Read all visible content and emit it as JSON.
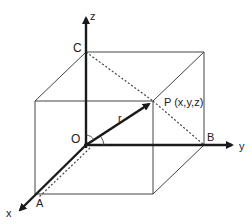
{
  "diagram": {
    "axes": {
      "x": {
        "label": "x"
      },
      "y": {
        "label": "y"
      },
      "z": {
        "label": "z"
      }
    },
    "points": {
      "origin": {
        "label": "O"
      },
      "A": {
        "label": "A"
      },
      "B": {
        "label": "B"
      },
      "C": {
        "label": "C"
      },
      "P": {
        "label": "P (x,y,z)"
      }
    },
    "vector": {
      "label": "r"
    },
    "colors": {
      "stroke": "#1a1a1a",
      "thin": "#444444",
      "background": "#ffffff"
    }
  }
}
